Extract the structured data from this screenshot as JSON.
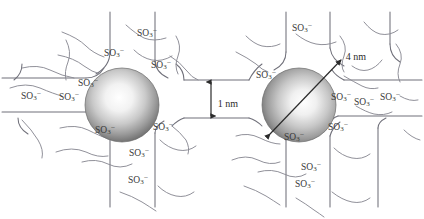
{
  "figure": {
    "background_color": "#ffffff",
    "line_color": "#6f6f78",
    "label_color": "#3a3a3a",
    "group_label": "SO3-",
    "group_label_html": "SO<sub>3</sub><sup>-</sup>"
  },
  "particles": [
    {
      "name": "nanoparticle-left",
      "cx": 122,
      "cy": 105,
      "r": 37,
      "gradient_highlight": "#ffffff",
      "gradient_mid": "#b8b8b8",
      "gradient_edge": "#6e6e6e"
    },
    {
      "name": "nanoparticle-right",
      "cx": 299,
      "cy": 105,
      "r": 37,
      "gradient_highlight": "#ffffff",
      "gradient_mid": "#b8b8b8",
      "gradient_edge": "#6e6e6e"
    }
  ],
  "annotations": [
    {
      "name": "gap-dimension",
      "text": "1 nm",
      "x": 228,
      "y": 103,
      "arrow": "vertical-double",
      "value": 1,
      "unit": "nm"
    },
    {
      "name": "diameter-dimension",
      "text": "4 nm",
      "x": 356,
      "y": 56,
      "arrow": "diagonal-double",
      "value": 4,
      "unit": "nm"
    }
  ],
  "sulfonate_labels": [
    {
      "x": 31,
      "y": 96,
      "name": "so3-left-edge-upper"
    },
    {
      "x": 69,
      "y": 97,
      "name": "so3-left-edge-lower"
    },
    {
      "x": 88,
      "y": 83,
      "name": "so3-left-particle-upperleft"
    },
    {
      "x": 114,
      "y": 53,
      "name": "so3-left-particle-top"
    },
    {
      "x": 147,
      "y": 33,
      "name": "so3-left-top-outer"
    },
    {
      "x": 161,
      "y": 65,
      "name": "so3-left-particle-upperright"
    },
    {
      "x": 105,
      "y": 130,
      "name": "so3-left-particle-lowerleft"
    },
    {
      "x": 163,
      "y": 127,
      "name": "so3-left-particle-lowerright"
    },
    {
      "x": 139,
      "y": 153,
      "name": "so3-left-bottom-mid"
    },
    {
      "x": 138,
      "y": 180,
      "name": "so3-left-bottom-lower"
    },
    {
      "x": 266,
      "y": 75,
      "name": "so3-right-particle-upperleft"
    },
    {
      "x": 302,
      "y": 28,
      "name": "so3-right-top-outer"
    },
    {
      "x": 341,
      "y": 97,
      "name": "so3-right-edge-upper"
    },
    {
      "x": 364,
      "y": 102,
      "name": "so3-right-edge-mid"
    },
    {
      "x": 390,
      "y": 97,
      "name": "so3-right-edge-lower"
    },
    {
      "x": 338,
      "y": 127,
      "name": "so3-right-particle-lowerright"
    },
    {
      "x": 294,
      "y": 137,
      "name": "so3-right-particle-bottom"
    },
    {
      "x": 311,
      "y": 167,
      "name": "so3-right-bottom-mid"
    },
    {
      "x": 305,
      "y": 184,
      "name": "so3-right-bottom-lower"
    }
  ]
}
